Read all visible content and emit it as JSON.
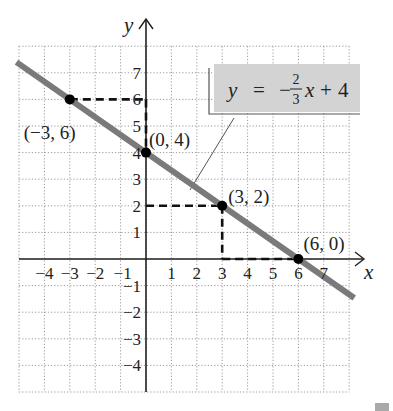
{
  "chart_data": {
    "type": "line",
    "title": "",
    "xlabel": "x",
    "ylabel": "y",
    "xlim": [
      -5,
      8
    ],
    "ylim": [
      -5,
      8
    ],
    "grid": true,
    "grid_style": "dotted",
    "x_ticks": [
      -4,
      -3,
      -2,
      -1,
      1,
      2,
      3,
      4,
      5,
      6,
      7
    ],
    "x_tick_labels": [
      "−4",
      "−3",
      "−2",
      "−1",
      "1",
      "2",
      "3",
      "4",
      "5",
      "6",
      "7"
    ],
    "y_ticks": [
      7,
      6,
      5,
      4,
      3,
      2,
      1,
      -1,
      -2,
      -3,
      -4
    ],
    "y_tick_labels": [
      "7",
      "6",
      "5",
      "4",
      "3",
      "2",
      "1",
      "−1",
      "−2",
      "−3",
      "−4"
    ],
    "series": [
      {
        "name": "y = −(2/3)x + 4",
        "slope": -0.6666667,
        "intercept": 4,
        "x": [
          -5.1,
          8.2
        ],
        "y": [
          7.4,
          -1.467
        ],
        "color": "#7a7a7a"
      }
    ],
    "points": [
      {
        "x": -3,
        "y": 6,
        "label": "(−3, 6)"
      },
      {
        "x": 0,
        "y": 4,
        "label": "(0, 4)"
      },
      {
        "x": 3,
        "y": 2,
        "label": "(3, 2)"
      },
      {
        "x": 6,
        "y": 0,
        "label": "(6, 0)"
      }
    ],
    "guides": [
      {
        "from": [
          -3,
          6
        ],
        "to": [
          0,
          6
        ],
        "style": "dashed"
      },
      {
        "from": [
          0,
          6
        ],
        "to": [
          0,
          4
        ],
        "style": "dashed"
      },
      {
        "from": [
          0,
          2
        ],
        "to": [
          3,
          2
        ],
        "style": "dashed"
      },
      {
        "from": [
          3,
          2
        ],
        "to": [
          3,
          0
        ],
        "style": "dashed"
      },
      {
        "from": [
          3,
          0
        ],
        "to": [
          6,
          0
        ],
        "style": "dashed"
      }
    ],
    "annotation": {
      "text_y": "y",
      "text_eq": "=",
      "text_minus": "−",
      "frac_num": "2",
      "frac_den": "3",
      "text_x": "x",
      "text_plus": "+",
      "text_const": "4",
      "box_color": "#d3d3d3"
    }
  },
  "colors": {
    "line": "#7a7a7a",
    "axis": "#222222",
    "grid": "#9a9a9a",
    "point": "#000000",
    "label_box": "#d3d3d3"
  }
}
